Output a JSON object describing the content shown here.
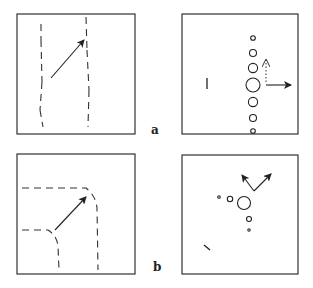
{
  "figure": {
    "rows": [
      {
        "label": "a",
        "left_panel": "two-parallel-dashed-lines-with-diagonal-arrow",
        "right_panel": "vertical-circle-column-with-right-arrow"
      },
      {
        "label": "b",
        "left_panel": "dashed-corner-curves-with-diagonal-arrow",
        "right_panel": "circle-cluster-with-v-arrows"
      }
    ]
  },
  "labels": {
    "a": "a",
    "b": "b"
  },
  "colors": {
    "stroke": "#222222",
    "background": "#ffffff"
  }
}
